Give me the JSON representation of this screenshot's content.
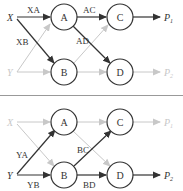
{
  "colors": {
    "active": "#333333",
    "faded": "#c8c8c8",
    "separator": "#999999",
    "background": "#ffffff"
  },
  "panels": [
    {
      "id": "top",
      "source_active": "X",
      "sources": [
        {
          "label": "X",
          "active": true
        },
        {
          "label": "Y",
          "active": false
        }
      ],
      "nodes": [
        "A",
        "B",
        "C",
        "D"
      ],
      "sinks": [
        {
          "label": "P",
          "sub": "1",
          "active": true
        },
        {
          "label": "P",
          "sub": "2",
          "active": false
        }
      ],
      "edges": [
        {
          "from": "X",
          "to": "A",
          "label": "XA",
          "active": true
        },
        {
          "from": "X",
          "to": "B",
          "label": "XB",
          "active": true
        },
        {
          "from": "A",
          "to": "C",
          "label": "AC",
          "active": true
        },
        {
          "from": "A",
          "to": "D",
          "label": "AD",
          "active": true
        },
        {
          "from": "C",
          "to": "P1",
          "label": "",
          "active": true
        },
        {
          "from": "Y",
          "to": "A",
          "label": "",
          "active": false
        },
        {
          "from": "Y",
          "to": "B",
          "label": "",
          "active": false
        },
        {
          "from": "B",
          "to": "C",
          "label": "",
          "active": false
        },
        {
          "from": "B",
          "to": "D",
          "label": "",
          "active": false
        },
        {
          "from": "D",
          "to": "P2",
          "label": "",
          "active": false
        }
      ]
    },
    {
      "id": "bottom",
      "source_active": "Y",
      "sources": [
        {
          "label": "X",
          "active": false
        },
        {
          "label": "Y",
          "active": true
        }
      ],
      "nodes": [
        "A",
        "B",
        "C",
        "D"
      ],
      "sinks": [
        {
          "label": "P",
          "sub": "1",
          "active": false
        },
        {
          "label": "P",
          "sub": "2",
          "active": true
        }
      ],
      "edges": [
        {
          "from": "Y",
          "to": "A",
          "label": "YA",
          "active": true
        },
        {
          "from": "Y",
          "to": "B",
          "label": "YB",
          "active": true
        },
        {
          "from": "B",
          "to": "C",
          "label": "BC",
          "active": true
        },
        {
          "from": "B",
          "to": "D",
          "label": "BD",
          "active": true
        },
        {
          "from": "D",
          "to": "P2",
          "label": "",
          "active": true
        },
        {
          "from": "X",
          "to": "A",
          "label": "",
          "active": false
        },
        {
          "from": "X",
          "to": "B",
          "label": "",
          "active": false
        },
        {
          "from": "A",
          "to": "C",
          "label": "",
          "active": false
        },
        {
          "from": "A",
          "to": "D",
          "label": "",
          "active": false
        },
        {
          "from": "C",
          "to": "P1",
          "label": "",
          "active": false
        }
      ]
    }
  ],
  "labels": {
    "top": {
      "X": "X",
      "Y": "Y",
      "A": "A",
      "B": "B",
      "C": "C",
      "D": "D",
      "P1": "P",
      "P1_sub": "1",
      "P2": "P",
      "P2_sub": "2",
      "XA": "XA",
      "XB": "XB",
      "AC": "AC",
      "AD": "AD"
    },
    "bottom": {
      "X": "X",
      "Y": "Y",
      "A": "A",
      "B": "B",
      "C": "C",
      "D": "D",
      "P1": "P",
      "P1_sub": "1",
      "P2": "P",
      "P2_sub": "2",
      "YA": "YA",
      "YB": "YB",
      "BC": "BC",
      "BD": "BD"
    }
  }
}
